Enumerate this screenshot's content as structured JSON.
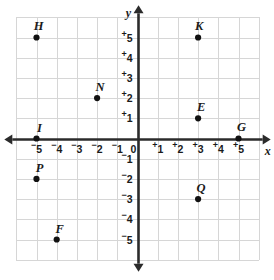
{
  "chart_data": {
    "type": "scatter",
    "title": "",
    "xlabel": "x",
    "ylabel": "y",
    "xlim": [
      -6,
      6
    ],
    "ylim": [
      -6,
      6
    ],
    "grid": true,
    "legend": "none",
    "x_tick_labels": [
      "⁻5",
      "⁻4",
      "⁻3",
      "⁻2",
      "⁻1",
      "0",
      "⁺1",
      "⁺2",
      "⁺3",
      "⁺4",
      "⁺5"
    ],
    "y_tick_labels": [
      "⁺5",
      "⁺4",
      "⁺3",
      "⁺2",
      "⁺1",
      "0",
      "⁻1",
      "⁻2",
      "⁻3",
      "⁻4",
      "⁻5"
    ],
    "x_ticks": [
      -5,
      -4,
      -3,
      -2,
      -1,
      0,
      1,
      2,
      3,
      4,
      5
    ],
    "y_ticks": [
      5,
      4,
      3,
      2,
      1,
      0,
      -1,
      -2,
      -3,
      -4,
      -5
    ],
    "points": [
      {
        "label": "H",
        "x": -5,
        "y": 5
      },
      {
        "label": "K",
        "x": 3,
        "y": 5
      },
      {
        "label": "N",
        "x": -2,
        "y": 2
      },
      {
        "label": "E",
        "x": 3,
        "y": 1
      },
      {
        "label": "I",
        "x": -5,
        "y": 0
      },
      {
        "label": "G",
        "x": 5,
        "y": 0
      },
      {
        "label": "P",
        "x": -5,
        "y": -2
      },
      {
        "label": "Q",
        "x": 3,
        "y": -3
      },
      {
        "label": "F",
        "x": -4,
        "y": -5
      }
    ]
  },
  "colors": {
    "grid": "#d6d6d6",
    "axis": "#2b2b2b",
    "point": "#111111",
    "text": "#1a1a1a",
    "background": "#ffffff"
  }
}
